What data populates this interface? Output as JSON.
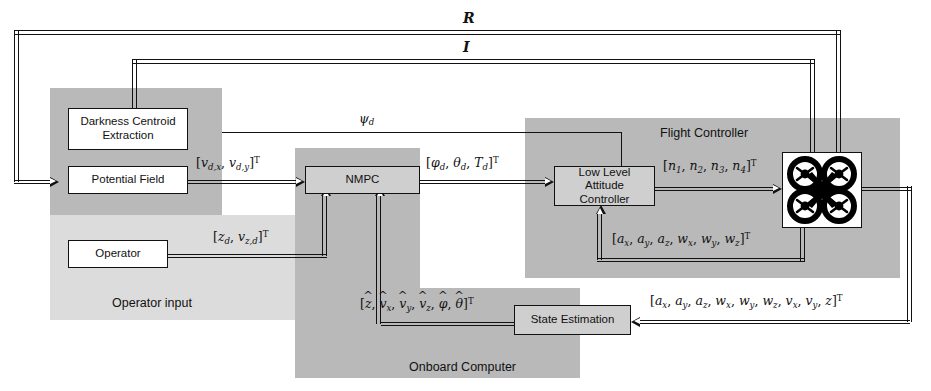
{
  "diagram": {
    "type": "block-diagram"
  },
  "groups": [
    {
      "id": "perception",
      "label": "",
      "shade": "dark"
    },
    {
      "id": "operator-input",
      "label": "Operator input",
      "shade": "light"
    },
    {
      "id": "onboard-computer",
      "label": "Onboard Computer",
      "shade": "dark"
    },
    {
      "id": "flight-controller",
      "label": "Flight Controller",
      "shade": "dark"
    }
  ],
  "blocks": {
    "darkness_centroid": {
      "line1": "Darkness Centroid",
      "line2": "Extraction"
    },
    "potential_field": {
      "label": "Potential Field"
    },
    "operator": {
      "label": "Operator"
    },
    "nmpc": {
      "label": "NMPC"
    },
    "low_level": {
      "line1": "Low Level Attitude",
      "line2": "Controller"
    },
    "state_estimation": {
      "label": "State Estimation"
    },
    "quadrotor": {
      "icon": "quadcopter-icon"
    }
  },
  "signals": {
    "range": {
      "name": "R",
      "description": "range sensor feedback to Potential Field"
    },
    "image": {
      "name": "I",
      "description": "image feedback to Darkness Centroid Extraction"
    },
    "yaw_desired": {
      "base": "ψ",
      "sub": "d"
    },
    "vel_desired": {
      "text": "[v_{d,x}, v_{d,y}]^T"
    },
    "operator_cmd": {
      "text": "[z_d, v_{z,d}]^T"
    },
    "attitude_cmd": {
      "text": "[φ_d, θ_d, T_d]^T"
    },
    "motor_speeds": {
      "text": "[n_1, n_2, n_3, n_4]^T"
    },
    "imu": {
      "text": "[a_x, a_y, a_z, w_x, w_y, w_z]^T"
    },
    "full_sensor": {
      "text": "[a_x, a_y, a_z, w_x, w_y, w_z, v_x, v_y, z]^T"
    },
    "state_est": {
      "text": "[z_hat, v_hat_x, v_hat_y, v_hat_z, phi_hat, theta_hat]^T"
    }
  },
  "colors": {
    "group_dark": "#b9b9b9",
    "group_light": "#dcdcdc",
    "block_fill": "#ffffff",
    "stroke": "#111111"
  }
}
